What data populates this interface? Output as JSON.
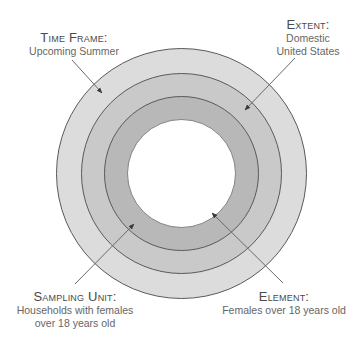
{
  "diagram": {
    "type": "concentric-circles",
    "colors": {
      "ring_outer": "#dcdcdc",
      "ring_second": "#c9c9c9",
      "ring_third": "#b8b8b8",
      "inner": "#ffffff",
      "stroke": "#5a5a5a",
      "leader": "#6a6a6a"
    },
    "labels": [
      {
        "id": "time-frame",
        "title": "Time Frame:",
        "desc_lines": [
          "Upcoming Summer"
        ]
      },
      {
        "id": "extent",
        "title": "Extent:",
        "desc_lines": [
          "Domestic",
          "United States"
        ]
      },
      {
        "id": "sampling-unit",
        "title": "Sampling Unit:",
        "desc_lines": [
          "Households with females",
          "over 18 years old"
        ]
      },
      {
        "id": "element",
        "title": "Element:",
        "desc_lines": [
          "Females over 18 years old"
        ]
      }
    ]
  }
}
